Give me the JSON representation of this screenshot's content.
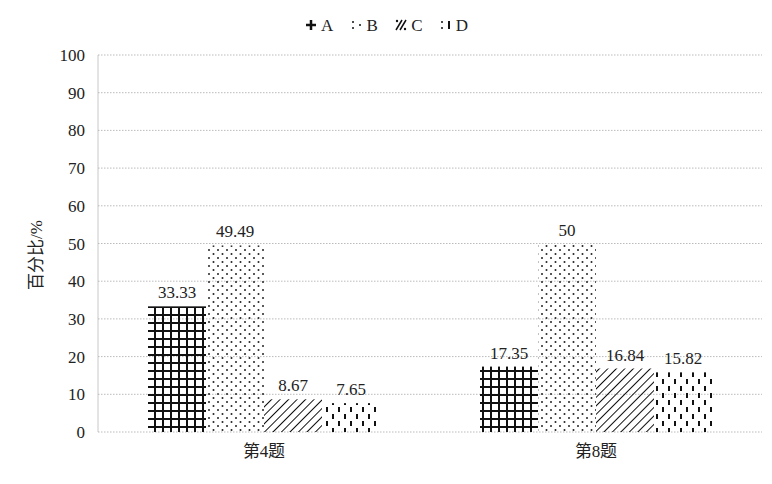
{
  "chart_data": {
    "type": "bar",
    "title": "",
    "xlabel": "",
    "ylabel": "百分比/%",
    "ylim": [
      0,
      100
    ],
    "yticks": [
      0,
      10,
      20,
      30,
      40,
      50,
      60,
      70,
      80,
      90,
      100
    ],
    "grid": true,
    "legend_position": "top",
    "categories": [
      "第4题",
      "第8题"
    ],
    "series": [
      {
        "name": "A",
        "pattern": "grid",
        "values": [
          33.33,
          17.35
        ]
      },
      {
        "name": "B",
        "pattern": "dots",
        "values": [
          49.49,
          50
        ]
      },
      {
        "name": "C",
        "pattern": "diagonal",
        "values": [
          8.67,
          16.84
        ]
      },
      {
        "name": "D",
        "pattern": "dashes",
        "values": [
          7.65,
          15.82
        ]
      }
    ],
    "data_labels": [
      [
        "33.33",
        "17.35"
      ],
      [
        "49.49",
        "50"
      ],
      [
        "8.67",
        "16.84"
      ],
      [
        "7.65",
        "15.82"
      ]
    ]
  },
  "legend": {
    "items": [
      "A",
      "B",
      "C",
      "D"
    ]
  },
  "axis": {
    "ylabel": "百分比/%"
  }
}
